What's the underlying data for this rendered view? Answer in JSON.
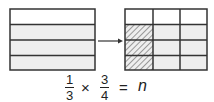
{
  "diagram": {
    "left_model": {
      "rows": 4,
      "unshaded_rows": 1,
      "shaded_rows": 3,
      "fill_shaded": "#eeeeee",
      "fill_unshaded": "#ffffff"
    },
    "arrow": "right-arrow",
    "right_model": {
      "rows": 4,
      "columns": 3,
      "shaded_rows": 3,
      "hatched_column": 1,
      "hatched_cells": 3
    },
    "colors": {
      "line": "#333333",
      "shade": "#eeeeee",
      "hatch": "#999999"
    }
  },
  "equation": {
    "frac1_num": "1",
    "frac1_den": "3",
    "times": "×",
    "frac2_num": "3",
    "frac2_den": "4",
    "equals": "=",
    "variable": "n"
  }
}
